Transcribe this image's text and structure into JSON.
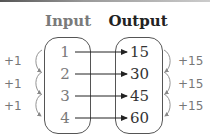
{
  "diagram": {
    "headers": {
      "input": "Input",
      "output": "Output"
    },
    "rows": [
      {
        "input": "1",
        "output": "15"
      },
      {
        "input": "2",
        "output": "30"
      },
      {
        "input": "3",
        "output": "45"
      },
      {
        "input": "4",
        "output": "60"
      }
    ],
    "input_steps": [
      "+1",
      "+1",
      "+1"
    ],
    "output_steps": [
      "+15",
      "+15",
      "+15"
    ],
    "colors": {
      "input_text": "#7a7a7a",
      "output_text": "#222222",
      "arrow": "#222222",
      "step_arrow": "#888888"
    }
  }
}
